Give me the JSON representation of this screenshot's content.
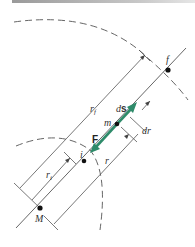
{
  "diagram": {
    "colors": {
      "line": "#555555",
      "dashed": "#666666",
      "vector": "#2e8b6a",
      "point": "#111111",
      "topbar": "#9a9a9a"
    },
    "points": {
      "M": "M",
      "m": "m",
      "i": "i",
      "f": "f"
    },
    "labels": {
      "r_f": "r",
      "r_f_sub": "f",
      "r_i": "r",
      "r_i_sub": "i",
      "r": "r",
      "ds": "ds",
      "ds_d": "d",
      "ds_s": "s",
      "dr": "dr",
      "F": "F"
    }
  }
}
